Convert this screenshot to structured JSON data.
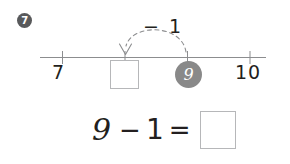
{
  "problem": {
    "number": "7",
    "badge_icon": "circled-number-badge"
  },
  "number_line": {
    "labels": {
      "left": "7",
      "right": "10"
    },
    "start_value": "9",
    "answer_placeholder": "",
    "jump_label": "− 1",
    "arrow_icon": "down-arrowhead-icon",
    "arc_icon": "dashed-jump-arc-icon",
    "tick_values": [
      "7",
      "8",
      "9",
      "10"
    ],
    "line_color": "#8c8d8f",
    "tick_color": "#8c8d8f",
    "chip_color": "#898989",
    "box_border_color": "#b6b7b9"
  },
  "equation": {
    "minuend": "9",
    "operator": "−",
    "subtrahend": "1",
    "equals": "=",
    "answer_placeholder": "",
    "text_color": "#231f20"
  }
}
